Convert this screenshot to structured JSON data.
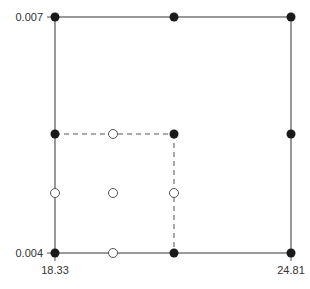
{
  "diagram": {
    "type": "sampling-grid",
    "y_axis": {
      "top_label": "0.007",
      "bottom_label": "0.004"
    },
    "x_axis": {
      "left_label": "18.33",
      "right_label": "24.81"
    },
    "colors": {
      "line": "#555555",
      "dot": "#1a1a1a",
      "open": "#ffffff"
    },
    "frame": {
      "x0": 55,
      "y0": 17,
      "x1": 291,
      "y1": 253
    },
    "inner_box": {
      "x0": 55,
      "y0": 134,
      "x1": 174,
      "y1": 253
    },
    "filled_points": [
      [
        55,
        17
      ],
      [
        174,
        17
      ],
      [
        291,
        17
      ],
      [
        55,
        134
      ],
      [
        174,
        134
      ],
      [
        291,
        134
      ],
      [
        55,
        253
      ],
      [
        174,
        253
      ],
      [
        291,
        253
      ]
    ],
    "open_points": [
      [
        113,
        134
      ],
      [
        55,
        193
      ],
      [
        113,
        193
      ],
      [
        174,
        193
      ],
      [
        113,
        253
      ]
    ]
  }
}
